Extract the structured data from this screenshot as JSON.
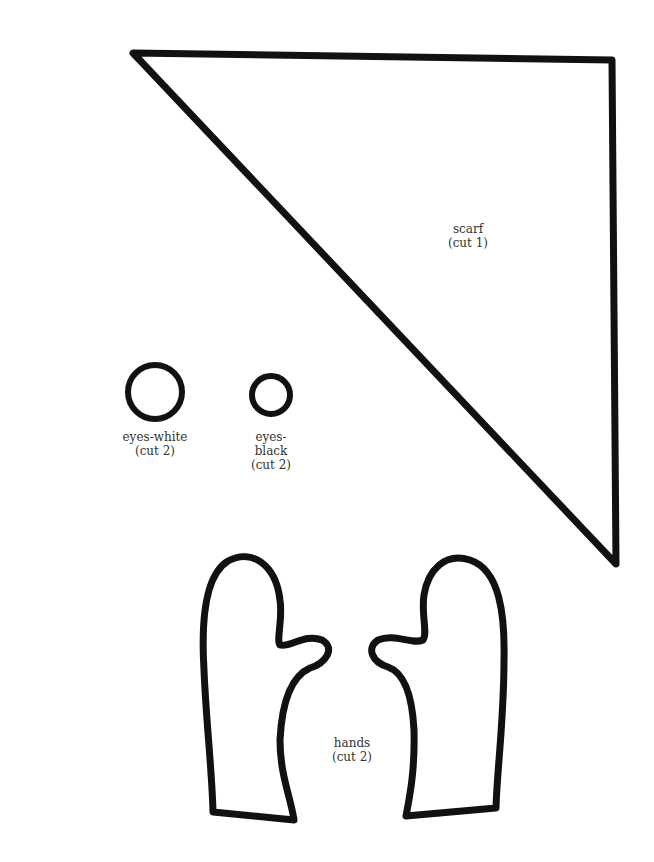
{
  "pieces": {
    "scarf": {
      "name": "scarf",
      "instruction": "(cut 1)"
    },
    "eyes_white": {
      "name": "eyes-white",
      "instruction": "(cut 2)"
    },
    "eyes_black": {
      "name_line1": "eyes-",
      "name_line2": "black",
      "instruction": "(cut 2)"
    },
    "hands": {
      "name": "hands",
      "instruction": "(cut 2)"
    }
  },
  "colors": {
    "outline": "#111111",
    "background": "#ffffff",
    "label": "#333333"
  }
}
